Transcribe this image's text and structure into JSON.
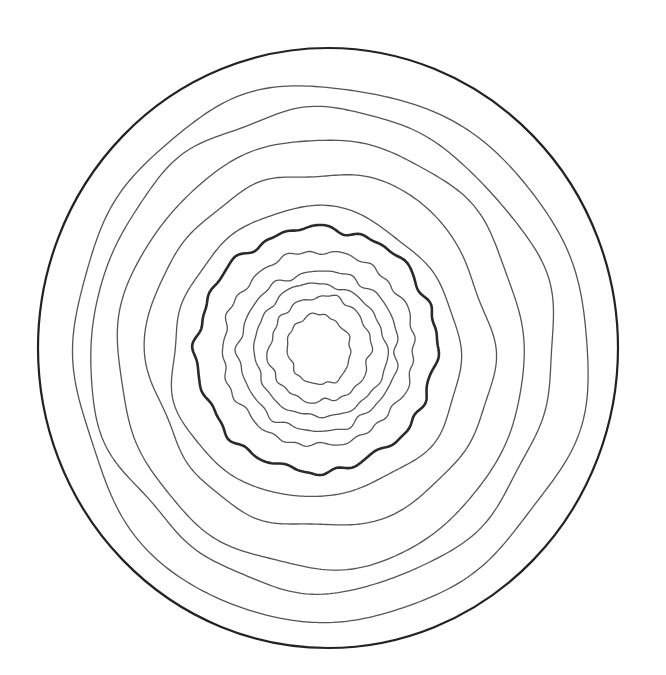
{
  "figure": {
    "width": 666,
    "height": 675,
    "background": "#ffffff",
    "boundary": {
      "cx": 328,
      "cy": 348,
      "rx": 290,
      "ry": 300,
      "stroke": "#222222",
      "width": 2.2
    },
    "highlight_ring_index": 5,
    "rings": [
      {
        "name": "ring-outer-1",
        "left": 72,
        "right": 585,
        "top": 85,
        "bottom": 622,
        "amp": 4.0,
        "freq": 9,
        "stroke": "#555555",
        "width": 1.3,
        "seed": 11
      },
      {
        "name": "ring-outer-2",
        "left": 91,
        "right": 553,
        "top": 110,
        "bottom": 590,
        "amp": 4.5,
        "freq": 10,
        "stroke": "#555555",
        "width": 1.3,
        "seed": 23
      },
      {
        "name": "ring-outer-3",
        "left": 118,
        "right": 525,
        "top": 140,
        "bottom": 568,
        "amp": 4.5,
        "freq": 9,
        "stroke": "#555555",
        "width": 1.3,
        "seed": 37
      },
      {
        "name": "ring-outer-4",
        "left": 148,
        "right": 493,
        "top": 173,
        "bottom": 528,
        "amp": 4.0,
        "freq": 10,
        "stroke": "#555555",
        "width": 1.3,
        "seed": 41
      },
      {
        "name": "ring-outer-5",
        "left": 170,
        "right": 460,
        "top": 210,
        "bottom": 498,
        "amp": 3.5,
        "freq": 9,
        "stroke": "#555555",
        "width": 1.3,
        "seed": 53
      },
      {
        "name": "ring-thick",
        "left": 197,
        "right": 436,
        "top": 227,
        "bottom": 472,
        "amp": 3.5,
        "freq": 24,
        "stroke": "#2a2a2a",
        "width": 2.6,
        "seed": 67
      },
      {
        "name": "ring-inner-1",
        "left": 222,
        "right": 415,
        "top": 252,
        "bottom": 445,
        "amp": 2.5,
        "freq": 22,
        "stroke": "#555555",
        "width": 1.3,
        "seed": 71
      },
      {
        "name": "ring-inner-2",
        "left": 240,
        "right": 397,
        "top": 270,
        "bottom": 432,
        "amp": 2.5,
        "freq": 20,
        "stroke": "#555555",
        "width": 1.3,
        "seed": 83
      },
      {
        "name": "ring-inner-3",
        "left": 255,
        "right": 385,
        "top": 283,
        "bottom": 418,
        "amp": 2.2,
        "freq": 18,
        "stroke": "#555555",
        "width": 1.3,
        "seed": 97
      },
      {
        "name": "ring-inner-4",
        "left": 270,
        "right": 370,
        "top": 296,
        "bottom": 403,
        "amp": 2.0,
        "freq": 16,
        "stroke": "#555555",
        "width": 1.3,
        "seed": 101
      },
      {
        "name": "ring-inner-5",
        "left": 288,
        "right": 350,
        "top": 314,
        "bottom": 385,
        "amp": 1.8,
        "freq": 14,
        "stroke": "#555555",
        "width": 1.3,
        "seed": 113
      }
    ]
  }
}
